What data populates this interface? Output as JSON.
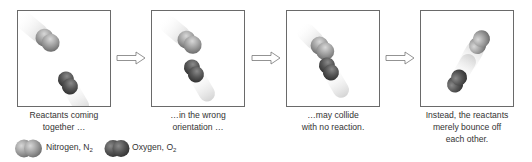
{
  "panels": [
    {
      "caption_line1": "Reactants coming",
      "caption_line2": "together …"
    },
    {
      "caption_line1": "…in the wrong",
      "caption_line2": "orientation …"
    },
    {
      "caption_line1": "…may collide",
      "caption_line2": "with no reaction."
    },
    {
      "caption_line1": "Instead, the reactants",
      "caption_line2": "merely bounce off",
      "caption_line3": "each other."
    }
  ],
  "legend": {
    "nitrogen_label": "Nitrogen, N",
    "nitrogen_sub": "2",
    "oxygen_label": "Oxygen, O",
    "oxygen_sub": "2"
  },
  "colors": {
    "nitrogen": "#9a9a9a",
    "oxygen": "#555555",
    "border": "#6a6a6a"
  }
}
